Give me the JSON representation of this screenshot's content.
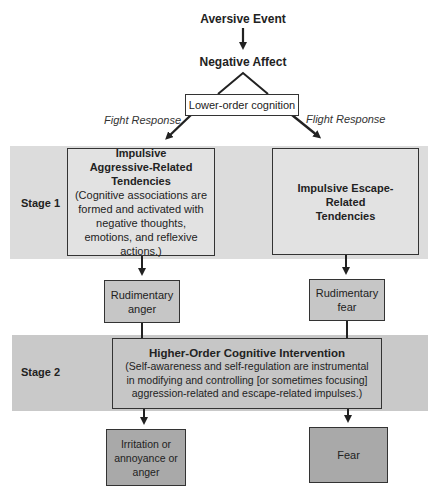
{
  "diagram": {
    "top": {
      "aversive_event": "Aversive Event",
      "negative_affect": "Negative Affect",
      "lower_order": "Lower-order cognition",
      "fight_label": "Fight Response",
      "flight_label": "Flight Response"
    },
    "stage1": {
      "label": "Stage 1",
      "left_box": {
        "title_lines": [
          "Impulsive",
          "Aggressive-Related",
          "Tendencies"
        ],
        "title": "Impulsive Aggressive-Related Tendencies",
        "body": "(Cognitive associations are formed and activated with negative thoughts, emotions, and reflexive actions.)"
      },
      "right_box": {
        "title": "Impulsive Escape-Related Tendencies"
      }
    },
    "rudimentary": {
      "left": "Rudimentary anger",
      "right": "Rudimentary fear"
    },
    "stage2": {
      "label": "Stage 2",
      "box_title": "Higher-Order Cognitive Intervention",
      "box_body": "(Self-awareness and self-regulation are instrumental in modifying and controlling [or sometimes focusing] aggression-related and escape-related impulses.)"
    },
    "outcomes": {
      "left": "Irritation or annoyance or anger",
      "right": "Fear"
    },
    "colors": {
      "band": "#dcdcdc",
      "band2": "#c9c9c9",
      "light_box": "#e2e2e2",
      "mid_box": "#c6c6c6",
      "dark_box": "#a9a9a9",
      "stroke": "#333333"
    }
  }
}
